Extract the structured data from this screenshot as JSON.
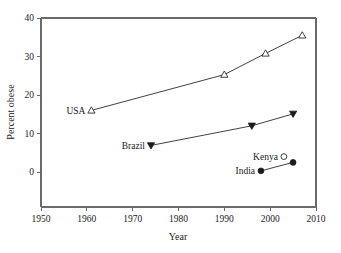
{
  "chart_data": {
    "type": "line",
    "title": "",
    "xlabel": "Year",
    "ylabel": "Percent obese",
    "xlim": [
      1950,
      2010
    ],
    "ylim": [
      0,
      40
    ],
    "xticks": [
      1950,
      1960,
      1970,
      1980,
      1990,
      2000,
      2010
    ],
    "xtick_labels": [
      "1950",
      "1960",
      "1970",
      "1980",
      "1990",
      "2000",
      "2010"
    ],
    "yticks": [
      0,
      10,
      20,
      30,
      40
    ],
    "ytick_labels": [
      "0",
      "10",
      "20",
      "30",
      "40"
    ],
    "grid": false,
    "legend": "inline-labels",
    "series": [
      {
        "name": "USA",
        "label": "USA",
        "marker": "triangle-up-open",
        "connected": true,
        "x": [
          1961,
          1990,
          1999,
          2007
        ],
        "y": [
          16.0,
          25.3,
          30.8,
          35.5
        ]
      },
      {
        "name": "Brazil",
        "label": "Brazil",
        "marker": "triangle-down-filled",
        "connected": true,
        "x": [
          1974,
          1996,
          2005
        ],
        "y": [
          6.9,
          12.0,
          15.1
        ]
      },
      {
        "name": "Kenya",
        "label": "Kenya",
        "marker": "circle-open",
        "connected": false,
        "x": [
          2003
        ],
        "y": [
          4.0
        ]
      },
      {
        "name": "India",
        "label": "India",
        "marker": "circle-filled",
        "connected": true,
        "x": [
          1998,
          2005
        ],
        "y": [
          0.3,
          2.5
        ]
      }
    ]
  },
  "colors": {
    "axis": "#6a6a6a",
    "line": "#2b2b2b",
    "marker_fill": "#1b1b1b",
    "marker_open_fill": "#ffffff",
    "text": "#1a1a1a",
    "background": "#ffffff"
  }
}
